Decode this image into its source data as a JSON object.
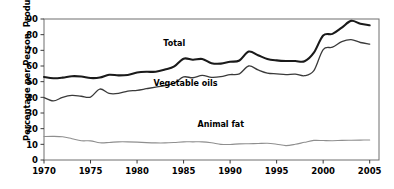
{
  "chart_data": {
    "type": "line",
    "title": "",
    "xlabel": "",
    "ylabel": "Percentage per Person, Product Weight",
    "xlim": [
      1970,
      2006
    ],
    "ylim": [
      0,
      90
    ],
    "grid": false,
    "legend_position": "inline-annotations",
    "xticks": [
      "1970",
      "1975",
      "1980",
      "1985",
      "1990",
      "1995",
      "2000",
      "2005"
    ],
    "xtick_values": [
      1970,
      1975,
      1980,
      1985,
      1990,
      1995,
      2000,
      2005
    ],
    "yticks": [
      "0",
      "10",
      "20",
      "30",
      "40",
      "50",
      "60",
      "70",
      "80",
      "90"
    ],
    "ytick_values": [
      0,
      10,
      20,
      30,
      40,
      50,
      60,
      70,
      80,
      90
    ],
    "x": [
      1970,
      1971,
      1972,
      1973,
      1974,
      1975,
      1976,
      1977,
      1978,
      1979,
      1980,
      1981,
      1982,
      1983,
      1984,
      1985,
      1986,
      1987,
      1988,
      1989,
      1990,
      1991,
      1992,
      1993,
      1994,
      1995,
      1996,
      1997,
      1998,
      1999,
      2000,
      2001,
      2002,
      2003,
      2004,
      2005
    ],
    "series": [
      {
        "name": "Total",
        "color": "#1a1a1a",
        "width": 2.1,
        "label_x": 1984,
        "label_y": 73,
        "values": [
          53.0,
          52.2,
          52.6,
          53.5,
          53.3,
          52.3,
          52.6,
          54.4,
          54.0,
          54.3,
          55.8,
          56.3,
          56.3,
          57.7,
          59.7,
          64.7,
          64.0,
          64.5,
          61.8,
          61.5,
          62.7,
          63.5,
          69.2,
          66.9,
          64.5,
          63.6,
          63.2,
          63.2,
          63.0,
          68.5,
          79.5,
          80.5,
          84.5,
          88.8,
          87.0,
          86.0
        ]
      },
      {
        "name": "Vegetable oils",
        "color": "#3a3a3a",
        "width": 1.3,
        "label_x": 1985.2,
        "label_y": 47,
        "values": [
          39.8,
          37.7,
          40.0,
          41.2,
          40.7,
          40.2,
          45.3,
          42.5,
          42.5,
          44.0,
          44.5,
          45.5,
          46.5,
          47.5,
          49.0,
          53.0,
          52.5,
          54.0,
          52.8,
          53.2,
          54.5,
          55.0,
          60.0,
          57.5,
          55.5,
          55.0,
          54.5,
          54.8,
          53.8,
          57.0,
          70.5,
          72.0,
          75.5,
          76.8,
          75.0,
          74.0
        ]
      },
      {
        "name": "Animal fat",
        "color": "#8f8f8f",
        "width": 1.1,
        "label_x": 1989,
        "label_y": 21,
        "values": [
          15.0,
          15.1,
          14.8,
          13.6,
          12.3,
          12.2,
          11.0,
          11.2,
          11.6,
          11.6,
          11.4,
          11.1,
          10.9,
          10.9,
          11.2,
          11.6,
          11.6,
          11.6,
          11.0,
          10.0,
          9.9,
          10.3,
          10.4,
          10.5,
          10.7,
          10.1,
          9.2,
          10.0,
          11.3,
          12.5,
          12.4,
          12.3,
          12.5,
          12.6,
          12.7,
          12.8
        ]
      }
    ]
  }
}
